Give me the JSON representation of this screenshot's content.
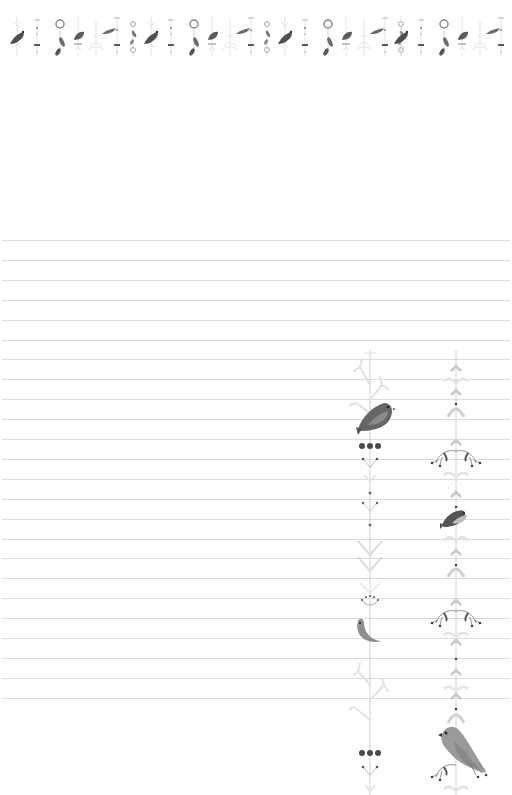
{
  "page": {
    "type": "lined-notepaper",
    "background": "#ffffff"
  },
  "colors": {
    "rule_line": "#dcdcdc",
    "ornament_light": "#d6d6d6",
    "ornament_mid": "#b5b5b5",
    "bird_dark": "#5e5e5e",
    "bird_mid": "#8c8c8c",
    "bird_light": "#a9a9a9",
    "dot_dark": "#4a4a4a"
  },
  "top_band": {
    "motif_sequence": [
      "perched-bird",
      "dotted-stem",
      "wreath-with-leaf",
      "small-bird",
      "branch-sprig",
      "flying-bird",
      "dotted-stem",
      "leaf-stem"
    ],
    "repeat_count": 4
  },
  "ruled_lines": {
    "count": 24,
    "first_y": 240,
    "spacing": 19.9
  },
  "right_border": {
    "columns": [
      {
        "name": "left-vine",
        "motifs": [
          "branch",
          "perched-bird",
          "berries",
          "sprig",
          "dot",
          "chevron-leaves",
          "fan-flower",
          "crescent-bird",
          "branch",
          "berries",
          "sprig"
        ]
      },
      {
        "name": "right-vine",
        "motifs": [
          "arrow-leaves",
          "dot",
          "leaf-pair",
          "swirl-branches",
          "small-bird",
          "leaf-pair",
          "swirl-branches",
          "arrow-leaves",
          "large-bird",
          "swirl-branches",
          "leaf-pair"
        ]
      }
    ]
  }
}
